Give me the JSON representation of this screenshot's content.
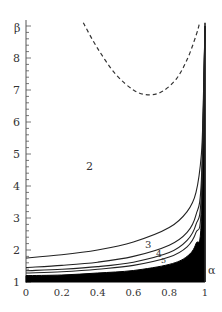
{
  "chart_data": {
    "type": "line",
    "title": "",
    "xlabel": "α",
    "ylabel": "β",
    "xlim": [
      0,
      1
    ],
    "ylim": [
      1,
      9
    ],
    "grid": false,
    "x_ticks": [
      "0",
      "0.2",
      "0.4",
      "0.6",
      "0.8",
      "1"
    ],
    "y_ticks": [
      "1",
      "2",
      "3",
      "4",
      "5",
      "6",
      "7",
      "8"
    ],
    "annotations": [
      {
        "text": "2",
        "x": 0.35,
        "y": 4.55
      },
      {
        "text": "3",
        "x": 0.68,
        "y": 2.1
      },
      {
        "text": "4",
        "x": 0.78,
        "y": 1.83
      },
      {
        "text": "5",
        "x": 0.82,
        "y": 1.65
      }
    ],
    "series": [
      {
        "name": "dashed boundary",
        "style": "dashed",
        "x": [
          0.32,
          0.4,
          0.5,
          0.6,
          0.68,
          0.76,
          0.84,
          0.9,
          0.95,
          0.97
        ],
        "y": [
          9.1,
          8.3,
          7.5,
          7.0,
          6.85,
          6.95,
          7.35,
          7.95,
          8.7,
          9.1
        ]
      },
      {
        "name": "curve 2",
        "style": "solid",
        "x": [
          0,
          0.2,
          0.4,
          0.6,
          0.8,
          0.9,
          0.95,
          0.98,
          0.99,
          1.0
        ],
        "y": [
          1.75,
          1.85,
          2.0,
          2.25,
          2.7,
          3.2,
          3.8,
          5.0,
          6.5,
          9.0
        ]
      },
      {
        "name": "curve 3",
        "style": "solid",
        "x": [
          0,
          0.2,
          0.4,
          0.6,
          0.8,
          0.9,
          0.95,
          0.98,
          1.0
        ],
        "y": [
          1.45,
          1.52,
          1.62,
          1.8,
          2.15,
          2.55,
          3.1,
          4.2,
          9.0
        ]
      },
      {
        "name": "curve 4",
        "style": "solid",
        "x": [
          0,
          0.2,
          0.4,
          0.6,
          0.8,
          0.9,
          0.95,
          0.98,
          1.0
        ],
        "y": [
          1.35,
          1.4,
          1.48,
          1.62,
          1.92,
          2.3,
          2.8,
          3.8,
          9.0
        ]
      },
      {
        "name": "curve 5",
        "style": "solid",
        "x": [
          0,
          0.2,
          0.4,
          0.6,
          0.8,
          0.9,
          0.95,
          0.98,
          1.0
        ],
        "y": [
          1.28,
          1.32,
          1.4,
          1.52,
          1.78,
          2.1,
          2.55,
          3.4,
          9.0
        ]
      },
      {
        "name": "black region upper edge",
        "style": "filled",
        "x": [
          0,
          0.2,
          0.4,
          0.6,
          0.8,
          0.9,
          0.95,
          0.98,
          1.0
        ],
        "y": [
          1.2,
          1.22,
          1.28,
          1.36,
          1.55,
          1.8,
          2.2,
          3.0,
          9.0
        ]
      }
    ]
  },
  "labels": {
    "x_axis": "α",
    "y_axis": "β",
    "region_2": "2",
    "region_3": "3",
    "region_4": "4",
    "region_5": "5"
  }
}
